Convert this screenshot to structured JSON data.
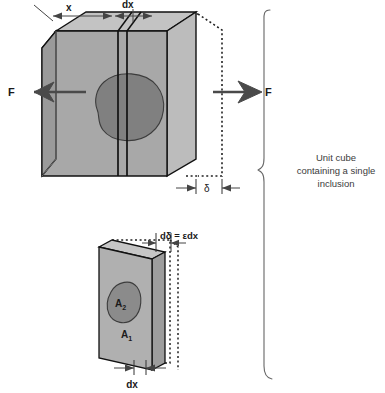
{
  "figure": {
    "background_color": "#ffffff"
  },
  "colors": {
    "front_face": "#a8a8a8",
    "top_face": "#c3c3c3",
    "side_face": "#9a9a9a",
    "slab_face": "#b0b0b0",
    "inclusion": "#808080",
    "outline": "#111111",
    "arrow": "#4a4a4a",
    "dashed": "#222222",
    "caption": "#3b3b3b"
  },
  "cube_diagram": {
    "name": "unit-cube-with-inclusion",
    "force_left_label": "F",
    "force_right_label": "F",
    "dimension_x_label": "x",
    "dimension_dx_label": "dx",
    "dimension_delta_label": "δ"
  },
  "slab_diagram": {
    "name": "slab-element",
    "area_matrix_label": "A",
    "area_matrix_sub": "1",
    "area_inclusion_label": "A",
    "area_inclusion_sub": "2",
    "extension_label": "dδ = εdx",
    "thickness_label": "dx"
  },
  "caption": {
    "line1": "Unit cube",
    "line2": "containing a single",
    "line3": "inclusion"
  }
}
